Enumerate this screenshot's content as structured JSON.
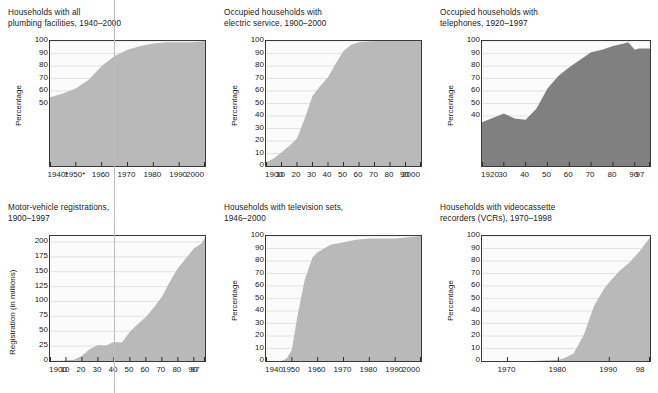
{
  "figure": {
    "background": "#ffffff",
    "fill_light": "#b9b9b9",
    "fill_dark": "#808080",
    "plot_bg": "#fbfbfb",
    "grid_color": "#d9d9d9",
    "axis_color": "#3a3a3a",
    "register_line_color": "#bdbdbd"
  },
  "panels": [
    {
      "id": "plumbing",
      "title": "Households with all\nplumbing facilities, 1940–2000",
      "ylabel": "Percentage",
      "fill": "#b9b9b9"
    },
    {
      "id": "electric",
      "title": "Occupied households with\nelectric service, 1900–2000",
      "ylabel": "Percentage",
      "fill": "#b9b9b9"
    },
    {
      "id": "telephones",
      "title": "Occupied households with\ntelephones, 1920–1997",
      "ylabel": "Percentage",
      "fill": "#808080"
    },
    {
      "id": "motor-vehicles",
      "title": "Motor-vehicle registrations,\n1900–1997",
      "ylabel": "Registration (in millions)",
      "fill": "#b9b9b9"
    },
    {
      "id": "television",
      "title": "Households with television sets,\n1946–2000",
      "ylabel": "Percentage",
      "fill": "#b9b9b9"
    },
    {
      "id": "vcr",
      "title": "Households with videocassette\nrecorders (VCRs), 1970–1998",
      "ylabel": "Percentage",
      "fill": "#b9b9b9"
    }
  ],
  "chart_data": [
    {
      "id": "plumbing",
      "type": "area",
      "title": "Households with all plumbing facilities, 1940–2000",
      "xlabel": "",
      "ylabel": "Percentage",
      "xlim": [
        1940,
        2000
      ],
      "ylim": [
        0,
        100
      ],
      "grid": true,
      "legend": null,
      "ytick_labels": [
        "50",
        "60",
        "70",
        "80",
        "90",
        "100"
      ],
      "yticks": [
        50,
        60,
        70,
        80,
        90,
        100
      ],
      "xtick_labels": [
        "1940*",
        "1950*",
        "1960",
        "1970",
        "1980",
        "1990",
        "2000"
      ],
      "xticks": [
        1940,
        1950,
        1960,
        1970,
        1980,
        1990,
        2000
      ],
      "x": [
        1940,
        1945,
        1950,
        1955,
        1960,
        1965,
        1970,
        1975,
        1980,
        1985,
        1990,
        1995,
        2000
      ],
      "values": [
        55,
        58,
        62,
        69,
        80,
        88,
        93,
        96,
        98,
        99,
        99,
        99,
        100
      ]
    },
    {
      "id": "electric",
      "type": "area",
      "title": "Occupied households with electric service, 1900–2000",
      "xlabel": "",
      "ylabel": "Percentage",
      "xlim": [
        1900,
        2000
      ],
      "ylim": [
        0,
        100
      ],
      "grid": true,
      "legend": null,
      "ytick_labels": [
        "0",
        "10",
        "20",
        "30",
        "40",
        "50",
        "60",
        "70",
        "80",
        "90",
        "100"
      ],
      "yticks": [
        0,
        10,
        20,
        30,
        40,
        50,
        60,
        70,
        80,
        90,
        100
      ],
      "xtick_labels": [
        "1900",
        "10",
        "20",
        "30",
        "40",
        "50",
        "60",
        "70",
        "80",
        "90",
        "2000"
      ],
      "xticks": [
        1900,
        1910,
        1920,
        1930,
        1940,
        1950,
        1960,
        1970,
        1980,
        1990,
        2000
      ],
      "x": [
        1900,
        1905,
        1910,
        1915,
        1920,
        1925,
        1930,
        1935,
        1940,
        1945,
        1950,
        1955,
        1960,
        1970,
        1980,
        1990,
        2000
      ],
      "values": [
        3,
        6,
        11,
        16,
        22,
        38,
        56,
        64,
        71,
        82,
        92,
        97,
        99,
        100,
        100,
        100,
        100
      ]
    },
    {
      "id": "telephones",
      "type": "area",
      "title": "Occupied households with telephones, 1920–1997",
      "xlabel": "",
      "ylabel": "Percentage",
      "xlim": [
        1920,
        1997
      ],
      "ylim": [
        0,
        100
      ],
      "grid": true,
      "legend": null,
      "ytick_labels": [
        "40",
        "50",
        "60",
        "70",
        "80",
        "90",
        "100"
      ],
      "yticks": [
        40,
        50,
        60,
        70,
        80,
        90,
        100
      ],
      "xtick_labels": [
        "1920",
        "30",
        "40",
        "50",
        "60",
        "70",
        "80",
        "90",
        "97"
      ],
      "xticks": [
        1920,
        1930,
        1940,
        1950,
        1960,
        1970,
        1980,
        1990,
        1997
      ],
      "x": [
        1920,
        1930,
        1935,
        1940,
        1945,
        1950,
        1955,
        1960,
        1965,
        1970,
        1975,
        1980,
        1985,
        1987,
        1990,
        1992,
        1997
      ],
      "values": [
        35,
        42,
        38,
        37,
        46,
        62,
        72,
        79,
        85,
        91,
        93,
        96,
        98,
        99,
        93,
        94,
        94
      ]
    },
    {
      "id": "motor-vehicles",
      "type": "area",
      "title": "Motor-vehicle registrations, 1900–1997",
      "xlabel": "",
      "ylabel": "Registration (in millions)",
      "xlim": [
        1900,
        1997
      ],
      "ylim": [
        0,
        210
      ],
      "grid": true,
      "legend": null,
      "ytick_labels": [
        "0",
        "25",
        "50",
        "75",
        "100",
        "125",
        "150",
        "175",
        "200"
      ],
      "yticks": [
        0,
        25,
        50,
        75,
        100,
        125,
        150,
        175,
        200
      ],
      "xtick_labels": [
        "1900",
        "10",
        "20",
        "30",
        "40",
        "50",
        "60",
        "70",
        "80",
        "90",
        "97"
      ],
      "xticks": [
        1900,
        1910,
        1920,
        1930,
        1940,
        1950,
        1960,
        1970,
        1980,
        1990,
        1997
      ],
      "x": [
        1900,
        1910,
        1915,
        1920,
        1925,
        1930,
        1935,
        1940,
        1945,
        1950,
        1955,
        1960,
        1965,
        1970,
        1975,
        1980,
        1985,
        1990,
        1995,
        1997
      ],
      "values": [
        0,
        1,
        2,
        9,
        20,
        27,
        26,
        32,
        31,
        49,
        62,
        74,
        90,
        108,
        133,
        156,
        172,
        189,
        198,
        208
      ]
    },
    {
      "id": "television",
      "type": "area",
      "title": "Households with television sets, 1946–2000",
      "xlabel": "",
      "ylabel": "Percentage",
      "xlim": [
        1940,
        2000
      ],
      "ylim": [
        0,
        100
      ],
      "grid": true,
      "legend": null,
      "ytick_labels": [
        "0",
        "10",
        "20",
        "30",
        "40",
        "50",
        "60",
        "70",
        "80",
        "90",
        "100"
      ],
      "yticks": [
        0,
        10,
        20,
        30,
        40,
        50,
        60,
        70,
        80,
        90,
        100
      ],
      "xtick_labels": [
        "1940",
        "1950",
        "1960",
        "1970",
        "1980",
        "1990",
        "2000"
      ],
      "xticks": [
        1940,
        1950,
        1960,
        1970,
        1980,
        1990,
        2000
      ],
      "x": [
        1940,
        1946,
        1948,
        1950,
        1952,
        1955,
        1958,
        1960,
        1965,
        1970,
        1975,
        1980,
        1985,
        1990,
        1995,
        2000
      ],
      "values": [
        0,
        0,
        2,
        9,
        34,
        65,
        83,
        87,
        93,
        95,
        97,
        98,
        98,
        98,
        99,
        100
      ]
    },
    {
      "id": "vcr",
      "type": "area",
      "title": "Households with videocassette recorders (VCRs), 1970–1998",
      "xlabel": "",
      "ylabel": "Percentage",
      "xlim": [
        1965,
        1998
      ],
      "ylim": [
        0,
        100
      ],
      "grid": true,
      "legend": null,
      "ytick_labels": [
        "0",
        "10",
        "20",
        "30",
        "40",
        "50",
        "60",
        "70",
        "80",
        "90",
        "100"
      ],
      "yticks": [
        0,
        10,
        20,
        30,
        40,
        50,
        60,
        70,
        80,
        90,
        100
      ],
      "xtick_labels": [
        "1970",
        "1980",
        "1990",
        "98"
      ],
      "xticks": [
        1970,
        1980,
        1990,
        1998
      ],
      "x": [
        1965,
        1970,
        1975,
        1980,
        1981,
        1983,
        1985,
        1987,
        1989,
        1990,
        1992,
        1994,
        1996,
        1998
      ],
      "values": [
        0,
        0,
        0,
        1,
        2,
        6,
        21,
        44,
        58,
        63,
        72,
        79,
        88,
        99
      ]
    }
  ]
}
